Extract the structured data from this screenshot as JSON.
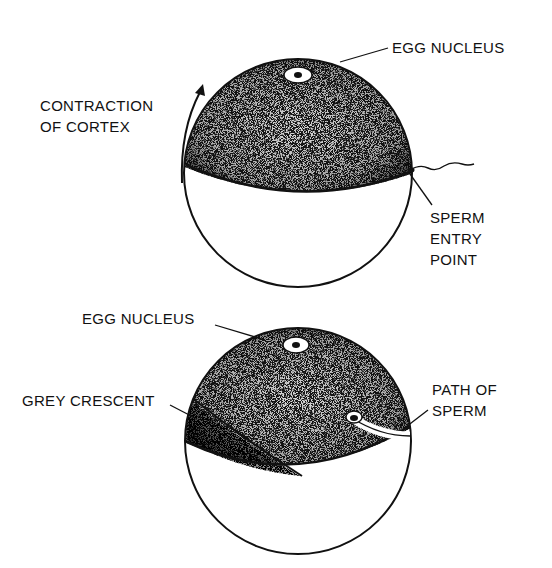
{
  "figure": {
    "background": "#ffffff",
    "ink_color": "#111111",
    "top_egg": {
      "labels": {
        "egg_nucleus": "EGG NUCLEUS",
        "contraction_line1": "CONTRACTION",
        "contraction_line2": "OF CORTEX",
        "sperm_line1": "SPERM",
        "sperm_line2": "ENTRY",
        "sperm_line3": "POINT"
      }
    },
    "bottom_egg": {
      "labels": {
        "egg_nucleus": "EGG NUCLEUS",
        "grey_crescent": "GREY CRESCENT",
        "path_line1": "PATH OF",
        "path_line2": "SPERM"
      }
    }
  }
}
